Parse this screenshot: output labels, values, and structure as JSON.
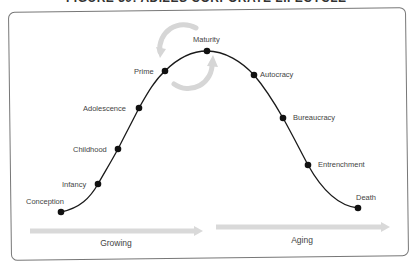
{
  "figure": {
    "title_fragment": "FIGURE 39: ADIZES CORPORATE LIFECYCLE"
  },
  "diagram": {
    "type": "lifecycle-curve",
    "stages": [
      {
        "label": "Conception",
        "x": 61,
        "y": 212,
        "lx": 26,
        "ly": 204,
        "anchor": "start"
      },
      {
        "label": "Infancy",
        "x": 98,
        "y": 184,
        "lx": 62,
        "ly": 187,
        "anchor": "start"
      },
      {
        "label": "Childhood",
        "x": 118,
        "y": 149,
        "lx": 73,
        "ly": 152,
        "anchor": "start"
      },
      {
        "label": "Adolescence",
        "x": 139,
        "y": 108,
        "lx": 83,
        "ly": 111,
        "anchor": "start"
      },
      {
        "label": "Prime",
        "x": 165,
        "y": 71,
        "lx": 134,
        "ly": 74,
        "anchor": "start"
      },
      {
        "label": "Maturity",
        "x": 207,
        "y": 51,
        "lx": 193,
        "ly": 42,
        "anchor": "start"
      },
      {
        "label": "Autocracy",
        "x": 254,
        "y": 75,
        "lx": 260,
        "ly": 77,
        "anchor": "start"
      },
      {
        "label": "Bureaucracy",
        "x": 283,
        "y": 118,
        "lx": 293,
        "ly": 120,
        "anchor": "start"
      },
      {
        "label": "Entrenchment",
        "x": 308,
        "y": 165,
        "lx": 318,
        "ly": 167,
        "anchor": "start"
      },
      {
        "label": "Death",
        "x": 358,
        "y": 208,
        "lx": 356,
        "ly": 200,
        "anchor": "start"
      }
    ],
    "phases": [
      {
        "label": "Growing",
        "x1": 30,
        "y": 231,
        "x2": 203,
        "lx": 116,
        "ly": 246
      },
      {
        "label": "Aging",
        "x1": 216,
        "y": 227,
        "x2": 390,
        "lx": 302,
        "ly": 243
      }
    ],
    "colors": {
      "curve": "#1a1a1a",
      "dot": "#111111",
      "arrow": "#d9d9d9",
      "cycle_arrow": "#d6d6d6",
      "frame": "#777777",
      "label": "#444444"
    }
  }
}
